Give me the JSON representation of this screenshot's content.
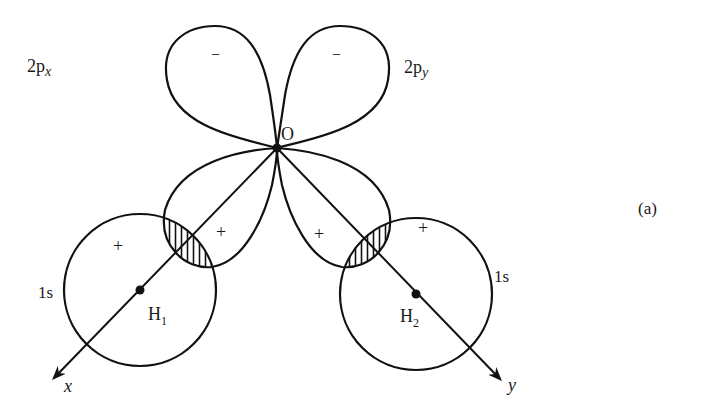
{
  "figure": {
    "panel_label": "(a)",
    "atoms": {
      "oxygen": "O",
      "hydrogen1": "H",
      "hydrogen1_sub": "1",
      "hydrogen2": "H",
      "hydrogen2_sub": "2"
    },
    "orbitals": {
      "p_x_label_main": "2p",
      "p_x_label_sub": "x",
      "p_y_label_main": "2p",
      "p_y_label_sub": "y",
      "s1_label": "1s",
      "s2_label": "1s"
    },
    "signs": {
      "px_upper": "−",
      "py_upper": "−",
      "px_lower": "+",
      "py_lower": "+",
      "h1": "+",
      "h2": "+"
    },
    "axes": {
      "x_label": "x",
      "y_label": "y"
    },
    "colors": {
      "line": "#111111",
      "background": "#ffffff"
    }
  }
}
